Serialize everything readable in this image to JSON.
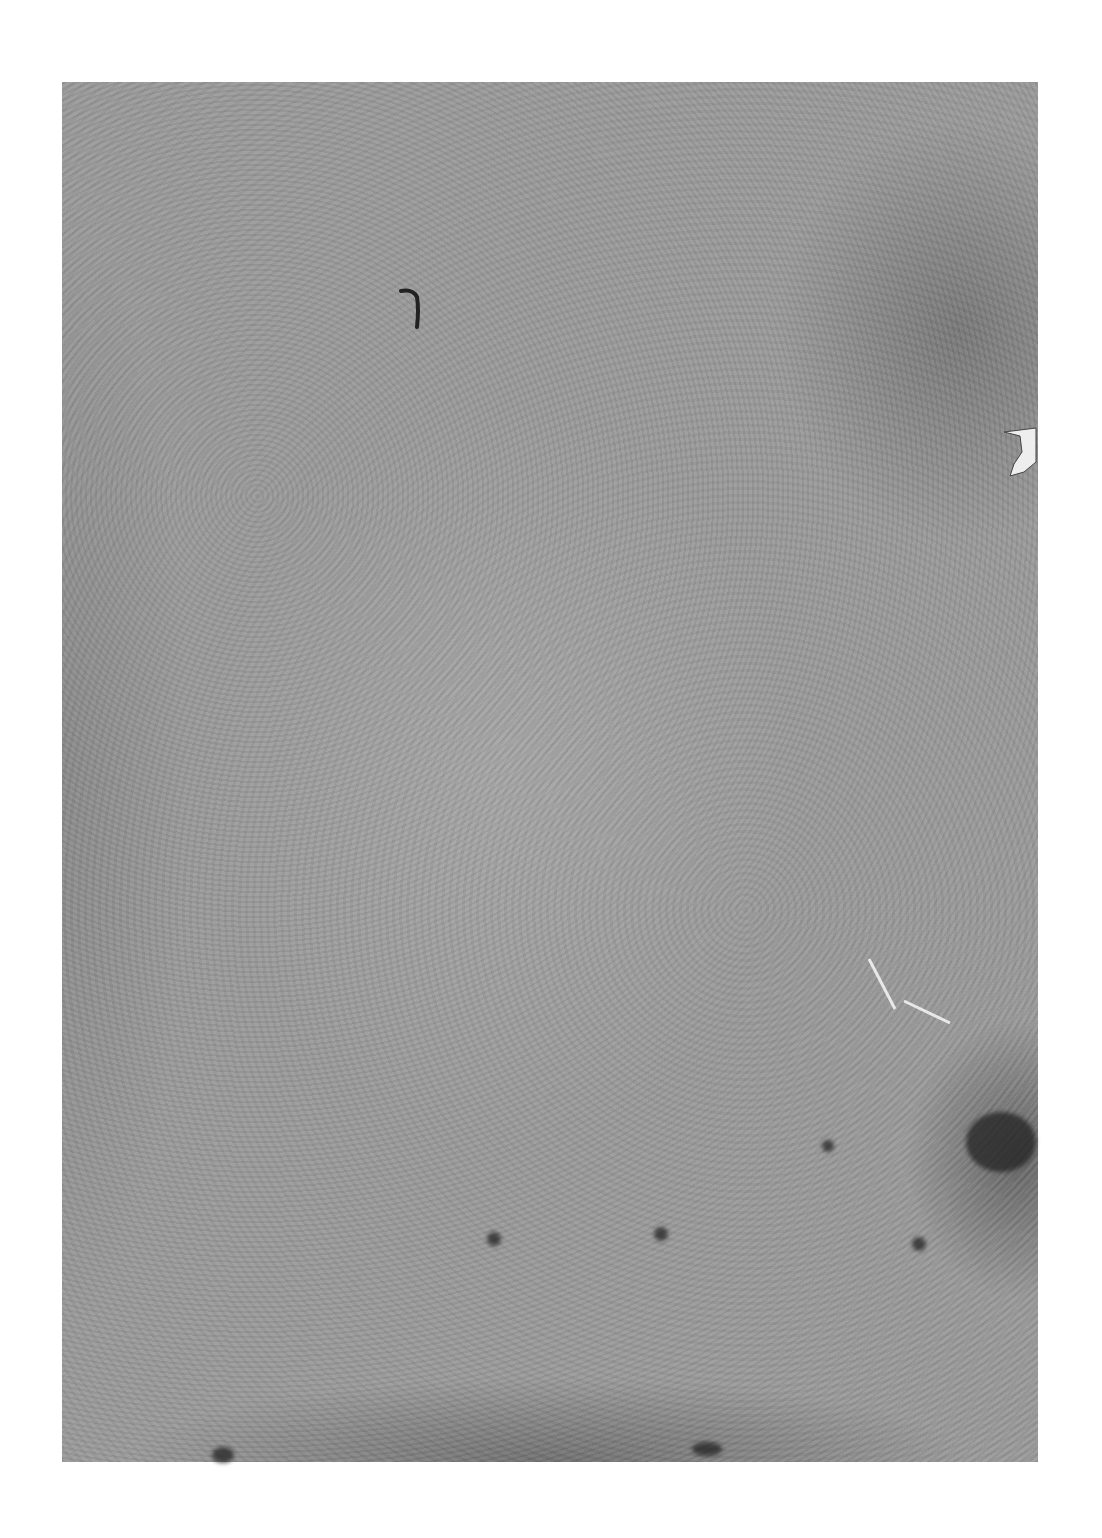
{
  "document": {
    "type": "scanned-page",
    "description": "Blank aged paper page with stains and texture; no legible text",
    "colors": {
      "background": "#ffffff",
      "paper": "#9a9a9a",
      "stain": "#3a3a3a"
    }
  }
}
